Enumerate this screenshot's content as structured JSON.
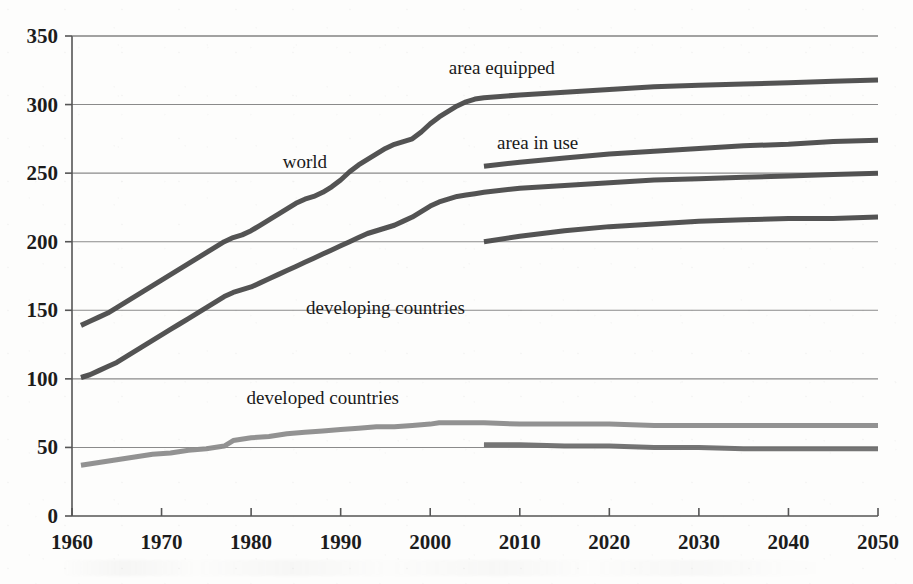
{
  "chart_data": {
    "type": "line",
    "title": "",
    "subtitle": "",
    "xlabel": "",
    "ylabel": "",
    "xlim": [
      1960,
      2050
    ],
    "ylim": [
      0,
      350
    ],
    "grid": true,
    "legend_position": "inline-annotations",
    "y_ticks": [
      0,
      50,
      100,
      150,
      200,
      250,
      300,
      350
    ],
    "y_tick_labels": [
      "0",
      "50",
      "100",
      "150",
      "200",
      "250",
      "300",
      "350"
    ],
    "x_ticks": [
      1960,
      1970,
      1980,
      1990,
      2000,
      2010,
      2020,
      2030,
      2040,
      2050
    ],
    "x_tick_labels": [
      "1960",
      "1970",
      "1980",
      "1990",
      "2000",
      "2010",
      "2020",
      "2030",
      "2040",
      "2050"
    ],
    "annotations": [
      {
        "text": "area equipped",
        "x": 2008,
        "y": 327
      },
      {
        "text": "area in use",
        "x": 2012,
        "y": 272
      },
      {
        "text": "world",
        "x": 1986,
        "y": 258
      },
      {
        "text": "developing countries",
        "x": 1995,
        "y": 152
      },
      {
        "text": "developed countries",
        "x": 1988,
        "y": 86
      }
    ],
    "series": [
      {
        "name": "world - area equipped",
        "label": "area equipped",
        "group": "world",
        "measure": "area equipped",
        "color": "#4a4a4a",
        "width": 5,
        "points": [
          [
            1961,
            139
          ],
          [
            1962,
            142
          ],
          [
            1963,
            145
          ],
          [
            1964,
            148
          ],
          [
            1965,
            152
          ],
          [
            1966,
            156
          ],
          [
            1967,
            160
          ],
          [
            1968,
            164
          ],
          [
            1969,
            168
          ],
          [
            1970,
            172
          ],
          [
            1971,
            176
          ],
          [
            1972,
            180
          ],
          [
            1973,
            184
          ],
          [
            1974,
            188
          ],
          [
            1975,
            192
          ],
          [
            1976,
            196
          ],
          [
            1977,
            200
          ],
          [
            1978,
            203
          ],
          [
            1979,
            205
          ],
          [
            1980,
            208
          ],
          [
            1981,
            212
          ],
          [
            1982,
            216
          ],
          [
            1983,
            220
          ],
          [
            1984,
            224
          ],
          [
            1985,
            228
          ],
          [
            1986,
            231
          ],
          [
            1987,
            233
          ],
          [
            1988,
            236
          ],
          [
            1989,
            240
          ],
          [
            1990,
            245
          ],
          [
            1991,
            251
          ],
          [
            1992,
            256
          ],
          [
            1993,
            260
          ],
          [
            1994,
            264
          ],
          [
            1995,
            268
          ],
          [
            1996,
            271
          ],
          [
            1997,
            273
          ],
          [
            1998,
            275
          ],
          [
            1999,
            280
          ],
          [
            2000,
            286
          ],
          [
            2001,
            291
          ],
          [
            2002,
            295
          ],
          [
            2003,
            299
          ],
          [
            2004,
            302
          ],
          [
            2005,
            304
          ],
          [
            2006,
            305
          ],
          [
            2010,
            307
          ],
          [
            2015,
            309
          ],
          [
            2020,
            311
          ],
          [
            2025,
            313
          ],
          [
            2030,
            314
          ],
          [
            2035,
            315
          ],
          [
            2040,
            316
          ],
          [
            2045,
            317
          ],
          [
            2050,
            318
          ]
        ]
      },
      {
        "name": "world - area in use",
        "label": "area in use",
        "group": "world",
        "measure": "area in use",
        "color": "#4a4a4a",
        "width": 5,
        "points": [
          [
            2006,
            255
          ],
          [
            2010,
            258
          ],
          [
            2015,
            261
          ],
          [
            2020,
            264
          ],
          [
            2025,
            266
          ],
          [
            2030,
            268
          ],
          [
            2035,
            270
          ],
          [
            2040,
            271
          ],
          [
            2045,
            273
          ],
          [
            2050,
            274
          ]
        ]
      },
      {
        "name": "developing countries - area equipped",
        "label": "developing countries",
        "group": "developing countries",
        "measure": "area equipped",
        "color": "#4a4a4a",
        "width": 5,
        "points": [
          [
            1961,
            101
          ],
          [
            1962,
            103
          ],
          [
            1963,
            106
          ],
          [
            1964,
            109
          ],
          [
            1965,
            112
          ],
          [
            1966,
            116
          ],
          [
            1967,
            120
          ],
          [
            1968,
            124
          ],
          [
            1969,
            128
          ],
          [
            1970,
            132
          ],
          [
            1971,
            136
          ],
          [
            1972,
            140
          ],
          [
            1973,
            144
          ],
          [
            1974,
            148
          ],
          [
            1975,
            152
          ],
          [
            1976,
            156
          ],
          [
            1977,
            160
          ],
          [
            1978,
            163
          ],
          [
            1979,
            165
          ],
          [
            1980,
            167
          ],
          [
            1981,
            170
          ],
          [
            1982,
            173
          ],
          [
            1983,
            176
          ],
          [
            1984,
            179
          ],
          [
            1985,
            182
          ],
          [
            1986,
            185
          ],
          [
            1987,
            188
          ],
          [
            1988,
            191
          ],
          [
            1989,
            194
          ],
          [
            1990,
            197
          ],
          [
            1991,
            200
          ],
          [
            1992,
            203
          ],
          [
            1993,
            206
          ],
          [
            1994,
            208
          ],
          [
            1995,
            210
          ],
          [
            1996,
            212
          ],
          [
            1997,
            215
          ],
          [
            1998,
            218
          ],
          [
            1999,
            222
          ],
          [
            2000,
            226
          ],
          [
            2001,
            229
          ],
          [
            2002,
            231
          ],
          [
            2003,
            233
          ],
          [
            2004,
            234
          ],
          [
            2005,
            235
          ],
          [
            2006,
            236
          ],
          [
            2010,
            239
          ],
          [
            2015,
            241
          ],
          [
            2020,
            243
          ],
          [
            2025,
            245
          ],
          [
            2030,
            246
          ],
          [
            2035,
            247
          ],
          [
            2040,
            248
          ],
          [
            2045,
            249
          ],
          [
            2050,
            250
          ]
        ]
      },
      {
        "name": "developing countries - area in use",
        "label": "area in use",
        "group": "developing countries",
        "measure": "area in use",
        "color": "#4a4a4a",
        "width": 5,
        "points": [
          [
            2006,
            200
          ],
          [
            2010,
            204
          ],
          [
            2015,
            208
          ],
          [
            2020,
            211
          ],
          [
            2025,
            213
          ],
          [
            2030,
            215
          ],
          [
            2035,
            216
          ],
          [
            2040,
            217
          ],
          [
            2045,
            217
          ],
          [
            2050,
            218
          ]
        ]
      },
      {
        "name": "developed countries - area equipped",
        "label": "developed countries",
        "group": "developed countries",
        "measure": "area equipped",
        "color": "#8c8c8c",
        "width": 5,
        "points": [
          [
            1961,
            37
          ],
          [
            1963,
            39
          ],
          [
            1965,
            41
          ],
          [
            1967,
            43
          ],
          [
            1969,
            45
          ],
          [
            1971,
            46
          ],
          [
            1973,
            48
          ],
          [
            1975,
            49
          ],
          [
            1977,
            51
          ],
          [
            1978,
            55
          ],
          [
            1980,
            57
          ],
          [
            1982,
            58
          ],
          [
            1984,
            60
          ],
          [
            1986,
            61
          ],
          [
            1988,
            62
          ],
          [
            1990,
            63
          ],
          [
            1992,
            64
          ],
          [
            1994,
            65
          ],
          [
            1996,
            65
          ],
          [
            1998,
            66
          ],
          [
            2000,
            67
          ],
          [
            2001,
            68
          ],
          [
            2003,
            68
          ],
          [
            2005,
            68
          ],
          [
            2006,
            68
          ],
          [
            2010,
            67
          ],
          [
            2015,
            67
          ],
          [
            2020,
            67
          ],
          [
            2025,
            66
          ],
          [
            2030,
            66
          ],
          [
            2035,
            66
          ],
          [
            2040,
            66
          ],
          [
            2045,
            66
          ],
          [
            2050,
            66
          ]
        ]
      },
      {
        "name": "developed countries - area in use",
        "label": "area in use",
        "group": "developed countries",
        "measure": "area in use",
        "color": "#6e6e6e",
        "width": 5,
        "points": [
          [
            2006,
            52
          ],
          [
            2010,
            52
          ],
          [
            2015,
            51
          ],
          [
            2020,
            51
          ],
          [
            2025,
            50
          ],
          [
            2030,
            50
          ],
          [
            2035,
            49
          ],
          [
            2040,
            49
          ],
          [
            2045,
            49
          ],
          [
            2050,
            49
          ]
        ]
      }
    ]
  },
  "style": {
    "axis_color": "#555555",
    "grid_color": "#777777",
    "background": "#fdfdfc",
    "dark_series_color": "#4a4a4a",
    "light_series_color": "#8c8c8c"
  }
}
